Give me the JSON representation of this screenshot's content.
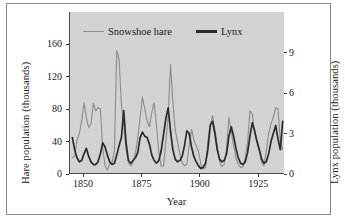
{
  "figure": {
    "background": "#ffffff",
    "panel_background": "#d2d2d2",
    "border_color": "#8a8a8a"
  },
  "axes": {
    "y_left_title": "Hare population (thousands)",
    "y_right_title": "Lynx population (thousands)",
    "x_title": "Year",
    "y_left_ticks": [
      "0",
      "40",
      "80",
      "120",
      "160"
    ],
    "y_right_ticks": [
      "0",
      "3",
      "6",
      "9"
    ],
    "x_ticks": [
      "1850",
      "1875",
      "1900",
      "1925"
    ]
  },
  "legend": {
    "hare_label": "Snowshoe hare",
    "lynx_label": "Lynx",
    "hare_color": "#8f8f8f",
    "lynx_color": "#2b2b2b"
  },
  "chart_data": {
    "type": "line",
    "title": "",
    "xlabel": "Year",
    "ylabel": "Hare population (thousands)",
    "y2label": "Lynx population (thousands)",
    "grid": false,
    "legend_position": "top-inside",
    "xlim": [
      1844,
      1936
    ],
    "ylim": [
      0,
      200
    ],
    "y2lim": [
      0,
      12
    ],
    "yticks": [
      0,
      40,
      80,
      120,
      160
    ],
    "y2ticks": [
      0,
      3,
      6,
      9
    ],
    "xticks": [
      1850,
      1875,
      1900,
      1925
    ],
    "x": [
      1845,
      1846,
      1847,
      1848,
      1849,
      1850,
      1851,
      1852,
      1853,
      1854,
      1855,
      1856,
      1857,
      1858,
      1859,
      1860,
      1861,
      1862,
      1863,
      1864,
      1865,
      1866,
      1867,
      1868,
      1869,
      1870,
      1871,
      1872,
      1873,
      1874,
      1875,
      1876,
      1877,
      1878,
      1879,
      1880,
      1881,
      1882,
      1883,
      1884,
      1885,
      1886,
      1887,
      1888,
      1889,
      1890,
      1891,
      1892,
      1893,
      1894,
      1895,
      1896,
      1897,
      1898,
      1899,
      1900,
      1901,
      1902,
      1903,
      1904,
      1905,
      1906,
      1907,
      1908,
      1909,
      1910,
      1911,
      1912,
      1913,
      1914,
      1915,
      1916,
      1917,
      1918,
      1919,
      1920,
      1921,
      1922,
      1923,
      1924,
      1925,
      1926,
      1927,
      1928,
      1929,
      1930,
      1931,
      1932,
      1933,
      1934,
      1935
    ],
    "series": [
      {
        "name": "Snowshoe hare",
        "axis": "left",
        "unit": "thousands",
        "color": "#8f8f8f",
        "values": [
          20,
          22,
          42,
          50,
          66,
          88,
          70,
          57,
          62,
          87,
          78,
          82,
          80,
          32,
          10,
          5,
          12,
          14,
          28,
          152,
          142,
          86,
          60,
          30,
          14,
          10,
          15,
          26,
          45,
          70,
          95,
          80,
          66,
          58,
          76,
          88,
          60,
          27,
          10,
          10,
          40,
          72,
          135,
          90,
          55,
          40,
          25,
          14,
          10,
          12,
          35,
          55,
          42,
          35,
          28,
          12,
          6,
          8,
          40,
          60,
          72,
          55,
          36,
          15,
          9,
          12,
          32,
          70,
          52,
          36,
          20,
          12,
          8,
          9,
          20,
          40,
          78,
          74,
          50,
          42,
          30,
          14,
          10,
          28,
          50,
          62,
          70,
          82,
          80,
          40,
          30
        ]
      },
      {
        "name": "Lynx",
        "axis": "right",
        "unit": "thousands",
        "color": "#2b2b2b",
        "values": [
          2.7,
          1.8,
          1.2,
          0.9,
          1.0,
          1.5,
          1.9,
          1.3,
          0.9,
          0.7,
          0.7,
          0.9,
          1.5,
          2.3,
          2.0,
          1.4,
          0.9,
          0.7,
          0.8,
          1.4,
          2.1,
          2.7,
          4.7,
          2.3,
          1.0,
          0.8,
          1.0,
          1.2,
          1.6,
          2.7,
          3.1,
          2.8,
          2.7,
          2.2,
          1.4,
          1.0,
          0.8,
          1.0,
          1.7,
          2.9,
          4.1,
          4.9,
          3.2,
          1.8,
          1.1,
          0.9,
          1.0,
          1.3,
          2.1,
          3.2,
          3.0,
          2.0,
          1.3,
          0.9,
          0.6,
          0.4,
          0.5,
          0.8,
          1.8,
          3.6,
          3.9,
          3.0,
          1.8,
          1.1,
          0.9,
          1.0,
          1.5,
          2.8,
          3.5,
          2.8,
          1.9,
          1.2,
          0.8,
          0.7,
          0.9,
          1.6,
          2.8,
          3.8,
          3.2,
          2.4,
          1.8,
          1.1,
          0.8,
          0.9,
          1.5,
          2.4,
          3.0,
          3.6,
          2.6,
          1.8,
          3.9
        ]
      }
    ]
  }
}
